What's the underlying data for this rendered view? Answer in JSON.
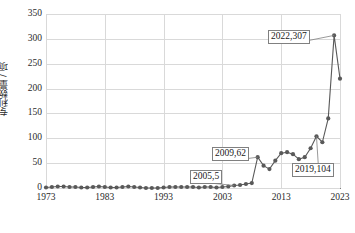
{
  "chart_data": {
    "type": "line",
    "title": "",
    "xlabel": "",
    "ylabel": "专利数量 / 项",
    "xlim": [
      1973,
      2023
    ],
    "ylim": [
      0,
      350
    ],
    "grid": true,
    "legend": "none",
    "marker": "circle",
    "line_color": "#595959",
    "marker_color": "#595959",
    "x_ticks": [
      "1973",
      "1983",
      "1993",
      "2003",
      "2013",
      "2023"
    ],
    "y_ticks": [
      "0",
      "50",
      "100",
      "150",
      "200",
      "250",
      "300",
      "350"
    ],
    "x": [
      1973,
      1974,
      1975,
      1976,
      1977,
      1978,
      1979,
      1980,
      1981,
      1982,
      1983,
      1984,
      1985,
      1986,
      1987,
      1988,
      1989,
      1990,
      1991,
      1992,
      1993,
      1994,
      1995,
      1996,
      1997,
      1998,
      1999,
      2000,
      2001,
      2002,
      2003,
      2004,
      2005,
      2006,
      2007,
      2008,
      2009,
      2010,
      2011,
      2012,
      2013,
      2014,
      2015,
      2016,
      2017,
      2018,
      2019,
      2020,
      2021,
      2022,
      2023
    ],
    "values": [
      1,
      2,
      3,
      3,
      2,
      2,
      1,
      1,
      2,
      3,
      2,
      1,
      1,
      2,
      3,
      2,
      1,
      0,
      0,
      0,
      1,
      2,
      2,
      2,
      2,
      2,
      1,
      2,
      2,
      1,
      2,
      3,
      5,
      6,
      8,
      10,
      62,
      45,
      38,
      55,
      70,
      72,
      68,
      58,
      62,
      80,
      104,
      92,
      140,
      307,
      220
    ],
    "annotations": [
      {
        "label": "2005,5",
        "x": 2005,
        "y": 5
      },
      {
        "label": "2009,62",
        "x": 2009,
        "y": 62
      },
      {
        "label": "2019,104",
        "x": 2019,
        "y": 104
      },
      {
        "label": "2022,307",
        "x": 2022,
        "y": 307
      }
    ]
  },
  "axis": {
    "y_title": "专利数量 / 项"
  }
}
